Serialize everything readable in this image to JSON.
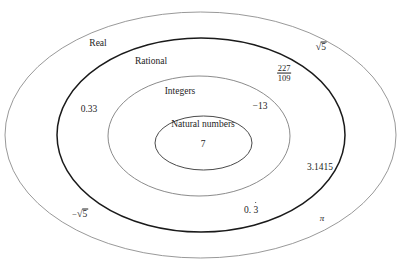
{
  "diagram": {
    "type": "nested-ellipses",
    "background": "#ffffff",
    "sets": [
      {
        "id": "real",
        "label": "Real",
        "label_x": 98,
        "label_y": 44,
        "ellipse": {
          "cx": 200.5,
          "cy": 135,
          "rx": 195.5,
          "ry": 123
        },
        "stroke": "#8d8d8d",
        "stroke_width": 0.9
      },
      {
        "id": "rational",
        "label": "Rational",
        "label_x": 151,
        "label_y": 62,
        "ellipse": {
          "cx": 201,
          "cy": 135,
          "rx": 144,
          "ry": 97
        },
        "stroke": "#1a1a1a",
        "stroke_width": 1.5
      },
      {
        "id": "integers",
        "label": "Integers",
        "label_x": 180,
        "label_y": 92,
        "ellipse": {
          "cx": 199,
          "cy": 136,
          "rx": 91,
          "ry": 60
        },
        "stroke": "#7e7e7e",
        "stroke_width": 0.9
      },
      {
        "id": "natural",
        "label": "Natural numbers",
        "label_x": 203,
        "label_y": 125,
        "ellipse": {
          "cx": 203.5,
          "cy": 143,
          "rx": 48.5,
          "ry": 27
        },
        "stroke": "#4a4a4a",
        "stroke_width": 1.0
      }
    ],
    "elements": [
      {
        "id": "seven",
        "text": "7",
        "kind": "plain",
        "set": "natural",
        "x": 203,
        "y": 145
      },
      {
        "id": "neg-thirteen",
        "text": "−13",
        "kind": "plain",
        "set": "integers-ring",
        "x": 260,
        "y": 107
      },
      {
        "id": "zero-33",
        "text": "0.33",
        "kind": "plain",
        "set": "rational-ring",
        "x": 89,
        "y": 110
      },
      {
        "id": "pi-approx",
        "text": "3.1415",
        "kind": "plain",
        "set": "rational-ring",
        "x": 320,
        "y": 168
      },
      {
        "id": "fraction",
        "numerator": "227",
        "denominator": "109",
        "kind": "fraction",
        "set": "rational-ring",
        "x": 284,
        "y": 73
      },
      {
        "id": "zero-point-three-repeating",
        "integer_part": "0. ",
        "repeating_digit": "3",
        "kind": "repeating-decimal",
        "set": "rational-ring",
        "x": 251,
        "y": 211
      },
      {
        "id": "sqrt-five",
        "sign": "",
        "radical": "√",
        "radicand": "5",
        "kind": "radical",
        "set": "real-ring",
        "x": 321,
        "y": 47
      },
      {
        "id": "neg-sqrt-five",
        "sign": "−",
        "radical": "√",
        "radicand": "5",
        "kind": "radical",
        "set": "real-ring",
        "x": 80,
        "y": 214
      },
      {
        "id": "pi",
        "text": "π",
        "kind": "pi",
        "set": "real-ring",
        "x": 322,
        "y": 219
      }
    ]
  }
}
